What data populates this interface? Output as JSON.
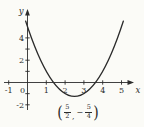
{
  "figure": {
    "background": "#fbfbf7",
    "ink_color": "#2b2b2b",
    "axes": {
      "x_axis_label": "x",
      "y_axis_label": "y",
      "x_tick_values": [
        -1,
        1,
        2,
        3,
        4,
        5
      ],
      "y_tick_values": [
        -2,
        -1,
        1,
        2,
        3,
        4
      ],
      "x_number_labels": [
        {
          "value": -1,
          "text": "-1",
          "dx": 0
        },
        {
          "value": 0,
          "text": "0",
          "dx": -5
        },
        {
          "value": 1,
          "text": "1",
          "dx": 0
        },
        {
          "value": 2,
          "text": "2",
          "dx": 0
        },
        {
          "value": 3,
          "text": "3",
          "dx": 0
        },
        {
          "value": 4,
          "text": "4",
          "dx": 0
        },
        {
          "value": 5,
          "text": "5",
          "dx": 0
        }
      ],
      "y_number_labels": [
        {
          "value": 4,
          "text": "4"
        },
        {
          "value": 2,
          "text": "2"
        },
        {
          "value": -2,
          "text": "-2"
        }
      ]
    },
    "vertex_annotation": {
      "open_paren": "(",
      "x_numerator": "5",
      "x_denominator": "2",
      "comma": ",",
      "minus_sign": "−",
      "y_numerator": "5",
      "y_denominator": "4",
      "close_paren": ")"
    }
  },
  "chart_data": {
    "type": "line",
    "title": "",
    "xlabel": "x",
    "ylabel": "y",
    "xlim": [
      -1.3,
      5.7
    ],
    "ylim": [
      -2.7,
      6.5
    ],
    "grid": false,
    "legend": "none",
    "x_ticks": [
      -1,
      0,
      1,
      2,
      3,
      4,
      5
    ],
    "y_ticks_labeled": [
      4,
      2,
      -2
    ],
    "y_ticks_minor": [
      -2,
      -1,
      1,
      2,
      3,
      4
    ],
    "function": "y = (x - 5/2)^2 - 5/4",
    "coefficient_a": 1,
    "vertex": [
      2.5,
      -1.25
    ],
    "vertex_label_text": "(5/2, −5/4)",
    "y_intercept": [
      0,
      5
    ],
    "x_intercepts": [
      1.382,
      3.618
    ],
    "draw_range": [
      -0.1,
      5.1
    ],
    "series": [
      {
        "name": "parabola",
        "x": [
          -0.1,
          0,
          0.25,
          0.5,
          0.75,
          1,
          1.25,
          1.5,
          1.75,
          2,
          2.25,
          2.5,
          2.75,
          3,
          3.25,
          3.5,
          3.75,
          4,
          4.25,
          4.5,
          4.75,
          5,
          5.1
        ],
        "y": [
          5.51,
          5,
          3.81,
          2.75,
          1.81,
          1,
          0.31,
          -0.25,
          -0.69,
          -1,
          -1.19,
          -1.25,
          -1.19,
          -1,
          -0.69,
          -0.25,
          0.31,
          1,
          1.81,
          2.75,
          3.81,
          5,
          5.51
        ]
      }
    ]
  }
}
